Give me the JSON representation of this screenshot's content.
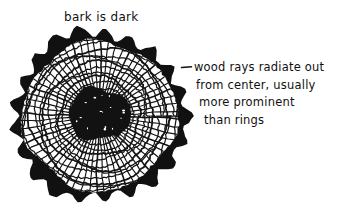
{
  "figure": {
    "kind": "hand-drawn-diagram",
    "background_color": "#ffffff",
    "ink_color": "#111111"
  },
  "annotations": {
    "bark_label": "bark is dark",
    "rays_note": {
      "line1": "wood rays radiate out",
      "line2": "from center, usually",
      "line3": "more prominent",
      "line4": "than rings"
    }
  },
  "drawing": {
    "center_x": 99,
    "center_y": 116,
    "outer_radius": 91,
    "bark_lobes": 21,
    "bark_thickness": 13,
    "wood_outer_radius": 76,
    "pith_radius_x": 31,
    "pith_radius_y": 26,
    "growth_rings": 13,
    "wood_rays": 64
  }
}
